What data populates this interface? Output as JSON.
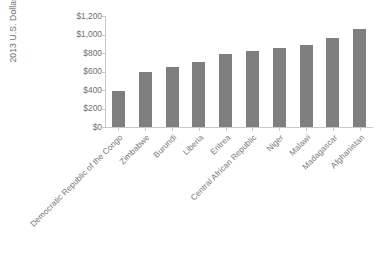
{
  "chart_data": {
    "type": "bar",
    "title": "",
    "subtitle": "",
    "xlabel": "",
    "ylabel": "2013 U.S. Dollars",
    "ylim": [
      0,
      1200
    ],
    "ytick_values": [
      0,
      200,
      400,
      600,
      800,
      1000,
      1200
    ],
    "ytick_labels": [
      "$0",
      "$200",
      "$400",
      "$600",
      "$800",
      "$1,000",
      "$1,200"
    ],
    "grid": false,
    "legend": false,
    "legend_position": "none",
    "bar_color": "#7f7f7f",
    "axis_color": "#c9c9c9",
    "text_color": "#6f6f6f",
    "background_color": "#ffffff",
    "categories": [
      "Democratic Republic of the Congo",
      "Zimbabwe",
      "Burundi",
      "Liberia",
      "Eritrea",
      "Central African Republic",
      "Niger",
      "Malawi",
      "Madagascar",
      "Afghanistan"
    ],
    "values": [
      390,
      590,
      645,
      705,
      790,
      820,
      850,
      890,
      965,
      1060
    ]
  }
}
